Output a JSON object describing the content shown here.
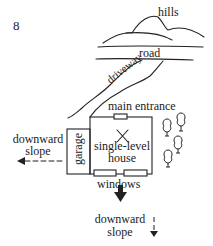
{
  "figure_number": "8",
  "labels": {
    "hills": "hills",
    "road": "road",
    "driveway": "driveway",
    "main_entrance": "main entrance",
    "garage": "garage",
    "house_line1": "single-level",
    "house_line2": "house",
    "windows": "windows",
    "left_slope_line1": "downward",
    "left_slope_line2": "slope",
    "bottom_slope_line1": "downward",
    "bottom_slope_line2": "slope"
  },
  "colors": {
    "ink": "#222222",
    "background": "#ffffff"
  }
}
